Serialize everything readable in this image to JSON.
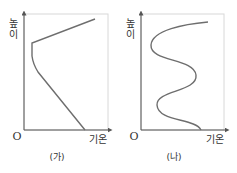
{
  "panels": [
    {
      "id": "ga",
      "caption": "(가)",
      "y_label_top": "높",
      "y_label_bottom": "이",
      "x_label": "기온",
      "origin_label": "O"
    },
    {
      "id": "na",
      "caption": "(나)",
      "y_label_top": "높",
      "y_label_bottom": "이",
      "x_label": "기온",
      "origin_label": "O"
    }
  ],
  "colors": {
    "curve": "#6e6e6e",
    "axis": "#555555",
    "frame": "#d8d8d8",
    "text": "#333333"
  }
}
